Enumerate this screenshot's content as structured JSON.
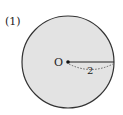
{
  "problem_label": "(1)",
  "circle": {
    "center_label": "O",
    "radius_label": "2",
    "fill": "#e3e3e3",
    "stroke": "#333333"
  }
}
